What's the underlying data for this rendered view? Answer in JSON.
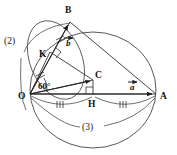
{
  "figure": {
    "background_color": "#ffffff",
    "ink_color": "#333333",
    "width": 177,
    "height": 155
  },
  "points": {
    "O": {
      "label": "O",
      "x": 30,
      "y": 94,
      "label_x": 20,
      "label_y": 99
    },
    "A": {
      "label": "A",
      "x": 156,
      "y": 94,
      "label_x": 160,
      "label_y": 99
    },
    "B": {
      "label": "B",
      "x": 70,
      "y": 22,
      "label_x": 66,
      "label_y": 12
    },
    "C": {
      "label": "C",
      "x": 93,
      "y": 80,
      "label_x": 95,
      "label_y": 77
    },
    "H": {
      "label": "H",
      "x": 93,
      "y": 94,
      "label_x": 90,
      "label_y": 106
    },
    "K": {
      "label": "K",
      "x": 50,
      "y": 52,
      "label_x": 41,
      "label_y": 56
    }
  },
  "vectors": {
    "a": {
      "label": "a",
      "from": "O",
      "to": "A",
      "label_x": 131,
      "label_y": 86
    },
    "b": {
      "label": "b",
      "from": "O",
      "to": "B",
      "label_x": 66,
      "label_y": 42
    },
    "c_short": {
      "label": "",
      "from": "O",
      "to": "C"
    }
  },
  "angles": {
    "at_O": {
      "label": "60°",
      "value": 60,
      "unit": "degrees",
      "label_x": 44,
      "label_y": 86
    }
  },
  "arc_labels": {
    "arc2": {
      "label": "(2)",
      "x": 9,
      "y": 40
    },
    "arc3": {
      "label": "(3)",
      "x": 85,
      "y": 127
    }
  },
  "markers": {
    "right_angle_at_H": {
      "name": "right-angle-marker",
      "x": 93,
      "y": 94,
      "size": 7
    },
    "right_angle_at_K": {
      "name": "right-angle-marker",
      "x": 50,
      "y": 52,
      "size": 6
    },
    "congruent_ticks_OK_KB": {
      "name": "double-tick-marks",
      "count": 2
    },
    "congruent_ticks_OH_HA": {
      "name": "triple-tick-marks",
      "count": 2
    }
  },
  "circles": {
    "main": {
      "cx": 93,
      "cy": 90,
      "rx": 63,
      "ry": 58
    },
    "inner": {
      "cx": 61,
      "cy": 63,
      "rx": 32,
      "ry": 42,
      "rotation": -28
    }
  },
  "notes": {
    "tick_style_upper": "||",
    "tick_style_lower": "|||"
  }
}
